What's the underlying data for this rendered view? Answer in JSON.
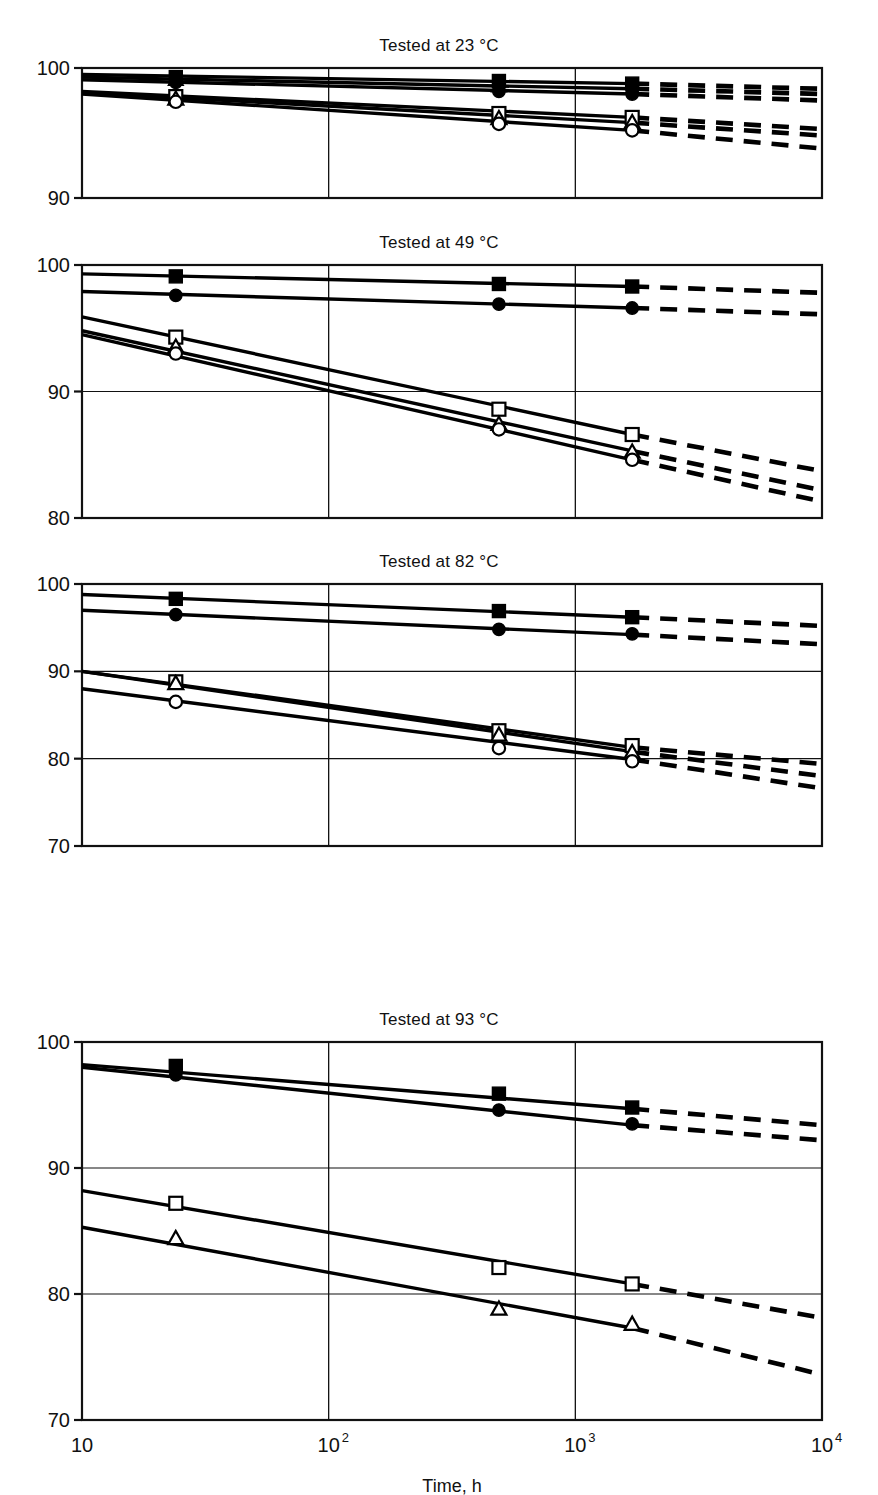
{
  "figure": {
    "xaxis_title": "Time, h",
    "x_tick_labels": [
      "10",
      "10",
      "10",
      "10"
    ],
    "x_tick_exponents": [
      "",
      "2",
      "3",
      "4"
    ],
    "x_tick_values": [
      10,
      100,
      1000,
      10000
    ]
  },
  "panels": [
    {
      "title": "Tested at 23 °C",
      "ylim": [
        90,
        100
      ],
      "y_ticks": [
        100,
        90
      ],
      "y_tick_labels": [
        "100",
        "90"
      ]
    },
    {
      "title": "Tested at 49 °C",
      "ylim": [
        80,
        100
      ],
      "y_ticks": [
        100,
        90,
        80
      ],
      "y_tick_labels": [
        "100",
        "90",
        "80"
      ]
    },
    {
      "title": "Tested at 82 °C",
      "ylim": [
        70,
        100
      ],
      "y_ticks": [
        100,
        90,
        80,
        70
      ],
      "y_tick_labels": [
        "100",
        "90",
        "80",
        "70"
      ]
    },
    {
      "title": "Tested at 93 °C",
      "ylim": [
        70,
        100
      ],
      "y_ticks": [
        100,
        90,
        80,
        70
      ],
      "y_tick_labels": [
        "100",
        "90",
        "80",
        "70"
      ]
    }
  ],
  "chart_data": {
    "type": "line",
    "xlabel": "Time, h",
    "ylabel": "",
    "xscale": "log",
    "xlim": [
      10,
      10000
    ],
    "grid": "major x and y gridlines",
    "legend": "none shown",
    "marker_styles": {
      "filled-square": "solid black square",
      "filled-triangle": "solid black triangle",
      "filled-circle": "solid black circle",
      "open-square": "white square, black outline",
      "open-triangle": "white triangle, black outline",
      "open-circle": "white circle, black outline"
    },
    "line_styles": {
      "solid": "fitted line over measured range 10 to ~1700 h",
      "dashed": "extrapolation from ~1700 h to 10000 h"
    },
    "panels": [
      {
        "title": "Tested at 23 °C",
        "ylim": [
          90,
          100
        ],
        "series": [
          {
            "name": "filled-square",
            "marker": "filled-square",
            "line_x": [
              10,
              1700,
              10000
            ],
            "line_y": [
              99.5,
              98.8,
              98.4
            ],
            "points_x": [
              24,
              490,
              1700
            ],
            "points_y": [
              99.3,
              99.0,
              98.8
            ]
          },
          {
            "name": "filled-triangle",
            "marker": "filled-triangle",
            "line_x": [
              10,
              1700,
              10000
            ],
            "line_y": [
              99.3,
              98.4,
              98.0
            ],
            "points_x": [
              24,
              490,
              1700
            ],
            "points_y": [
              99.1,
              98.6,
              98.4
            ]
          },
          {
            "name": "filled-circle",
            "marker": "filled-circle",
            "line_x": [
              10,
              1700,
              10000
            ],
            "line_y": [
              99.1,
              98.0,
              97.5
            ],
            "points_x": [
              24,
              490,
              1700
            ],
            "points_y": [
              98.9,
              98.2,
              98.0
            ]
          },
          {
            "name": "open-square",
            "marker": "open-square",
            "line_x": [
              10,
              1700,
              10000
            ],
            "line_y": [
              98.2,
              96.2,
              95.3
            ],
            "points_x": [
              24,
              490,
              1700
            ],
            "points_y": [
              97.8,
              96.5,
              96.2
            ]
          },
          {
            "name": "open-triangle",
            "marker": "open-triangle",
            "line_x": [
              10,
              1700,
              10000
            ],
            "line_y": [
              98.1,
              95.8,
              94.8
            ],
            "points_x": [
              24,
              490,
              1700
            ],
            "points_y": [
              97.6,
              96.1,
              95.8
            ]
          },
          {
            "name": "open-circle",
            "marker": "open-circle",
            "line_x": [
              10,
              1700,
              10000
            ],
            "line_y": [
              98.0,
              95.2,
              93.8
            ],
            "points_x": [
              24,
              490,
              1700
            ],
            "points_y": [
              97.4,
              95.7,
              95.2
            ]
          }
        ]
      },
      {
        "title": "Tested at 49 °C",
        "ylim": [
          80,
          100
        ],
        "series": [
          {
            "name": "filled-square",
            "marker": "filled-square",
            "line_x": [
              10,
              1700,
              10000
            ],
            "line_y": [
              99.3,
              98.3,
              97.8
            ],
            "points_x": [
              24,
              490,
              1700
            ],
            "points_y": [
              99.1,
              98.5,
              98.3
            ]
          },
          {
            "name": "filled-circle",
            "marker": "filled-circle",
            "line_x": [
              10,
              1700,
              10000
            ],
            "line_y": [
              97.9,
              96.6,
              96.1
            ],
            "points_x": [
              24,
              490,
              1700
            ],
            "points_y": [
              97.6,
              96.9,
              96.6
            ]
          },
          {
            "name": "open-square",
            "marker": "open-square",
            "line_x": [
              10,
              1700,
              10000
            ],
            "line_y": [
              95.9,
              86.6,
              83.7
            ],
            "points_x": [
              24,
              490,
              1700
            ],
            "points_y": [
              94.3,
              88.6,
              86.6
            ]
          },
          {
            "name": "open-triangle",
            "marker": "open-triangle",
            "line_x": [
              10,
              1700,
              10000
            ],
            "line_y": [
              94.8,
              85.3,
              82.2
            ],
            "points_x": [
              24,
              490,
              1700
            ],
            "points_y": [
              93.5,
              87.4,
              85.2
            ]
          },
          {
            "name": "open-circle",
            "marker": "open-circle",
            "line_x": [
              10,
              1700,
              10000
            ],
            "line_y": [
              94.5,
              84.6,
              81.3
            ],
            "points_x": [
              24,
              490,
              1700
            ],
            "points_y": [
              93.0,
              87.0,
              84.6
            ]
          }
        ]
      },
      {
        "title": "Tested at 82 °C",
        "ylim": [
          70,
          100
        ],
        "series": [
          {
            "name": "filled-square",
            "marker": "filled-square",
            "line_x": [
              10,
              1700,
              10000
            ],
            "line_y": [
              98.8,
              96.2,
              95.2
            ],
            "points_x": [
              24,
              490,
              1700
            ],
            "points_y": [
              98.3,
              96.9,
              96.2
            ]
          },
          {
            "name": "filled-circle",
            "marker": "filled-circle",
            "line_x": [
              10,
              1700,
              10000
            ],
            "line_y": [
              97.0,
              94.2,
              93.1
            ],
            "points_x": [
              24,
              490,
              1700
            ],
            "points_y": [
              96.5,
              94.8,
              94.3
            ]
          },
          {
            "name": "open-square",
            "marker": "open-square",
            "line_x": [
              10,
              1700,
              10000
            ],
            "line_y": [
              90.0,
              81.3,
              79.4
            ],
            "points_x": [
              24,
              490,
              1700
            ],
            "points_y": [
              88.8,
              83.2,
              81.5
            ]
          },
          {
            "name": "open-triangle",
            "marker": "open-triangle",
            "line_x": [
              10,
              1700,
              10000
            ],
            "line_y": [
              90.0,
              80.8,
              78.0
            ],
            "points_x": [
              24,
              490,
              1700
            ],
            "points_y": [
              88.6,
              82.7,
              80.7
            ]
          },
          {
            "name": "open-circle",
            "marker": "open-circle",
            "line_x": [
              10,
              1700,
              10000
            ],
            "line_y": [
              88.0,
              79.9,
              76.6
            ],
            "points_x": [
              24,
              490,
              1700
            ],
            "points_y": [
              86.5,
              81.2,
              79.7
            ]
          }
        ]
      },
      {
        "title": "Tested at 93 °C",
        "ylim": [
          70,
          100
        ],
        "series": [
          {
            "name": "filled-square",
            "marker": "filled-square",
            "line_x": [
              10,
              1700,
              10000
            ],
            "line_y": [
              98.2,
              94.7,
              93.4
            ],
            "points_x": [
              24,
              490,
              1700
            ],
            "points_y": [
              98.1,
              95.9,
              94.8
            ]
          },
          {
            "name": "filled-circle",
            "marker": "filled-circle",
            "line_x": [
              10,
              1700,
              10000
            ],
            "line_y": [
              98.0,
              93.4,
              92.2
            ],
            "points_x": [
              24,
              490,
              1700
            ],
            "points_y": [
              97.4,
              94.6,
              93.5
            ]
          },
          {
            "name": "open-square",
            "marker": "open-square",
            "line_x": [
              10,
              1700,
              10000
            ],
            "line_y": [
              88.2,
              80.8,
              78.1
            ],
            "points_x": [
              24,
              490,
              1700
            ],
            "points_y": [
              87.2,
              82.1,
              80.8
            ]
          },
          {
            "name": "open-triangle",
            "marker": "open-triangle",
            "line_x": [
              10,
              1700,
              10000
            ],
            "line_y": [
              85.3,
              77.3,
              73.6
            ],
            "points_x": [
              24,
              490,
              1700
            ],
            "points_y": [
              84.4,
              78.8,
              77.6
            ]
          }
        ]
      }
    ]
  }
}
